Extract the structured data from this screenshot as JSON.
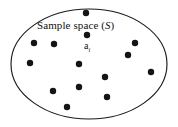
{
  "figure": {
    "type": "venn-sample-space-diagram",
    "background_color": "#ffffff",
    "width": 178,
    "height": 127,
    "sample_space": {
      "shape": "ellipse",
      "center_x": 89,
      "center_y": 64,
      "radius_x": 78,
      "radius_y": 55,
      "stroke_color": "#1a1a1a",
      "fill_color": "#ffffff",
      "stroke_width": 1.15
    },
    "space_label": {
      "prefix": "Sample space (",
      "symbol": "S",
      "suffix": ")",
      "full_text": "Sample space (S)",
      "x": 37,
      "y": 20
    },
    "point_label": {
      "base": "a",
      "subscript": "i",
      "full_text": "ai",
      "x": 84,
      "y": 41
    },
    "dot_color": "#141414",
    "dot_radius": 3.2,
    "dots": [
      {
        "name": "outcome-point-top",
        "cx": 86,
        "cy": 13
      },
      {
        "name": "outcome-point-ai",
        "cx": 87,
        "cy": 35,
        "labeled": true
      },
      {
        "name": "outcome-point-upper-left",
        "cx": 34,
        "cy": 43
      },
      {
        "name": "outcome-point-upper-mid",
        "cx": 54,
        "cy": 44
      },
      {
        "name": "outcome-point-upper-right",
        "cx": 135,
        "cy": 43
      },
      {
        "name": "outcome-point-left",
        "cx": 30,
        "cy": 63
      },
      {
        "name": "outcome-point-right-inner",
        "cx": 128,
        "cy": 55
      },
      {
        "name": "outcome-point-center",
        "cx": 79,
        "cy": 64
      },
      {
        "name": "outcome-point-far-right",
        "cx": 151,
        "cy": 72
      },
      {
        "name": "outcome-point-mid-right",
        "cx": 105,
        "cy": 77
      },
      {
        "name": "outcome-point-lower-mid",
        "cx": 79,
        "cy": 87
      },
      {
        "name": "outcome-point-lower-left",
        "cx": 53,
        "cy": 91
      },
      {
        "name": "outcome-point-lower-right",
        "cx": 107,
        "cy": 97
      },
      {
        "name": "outcome-point-bottom-left",
        "cx": 67,
        "cy": 107
      }
    ]
  }
}
